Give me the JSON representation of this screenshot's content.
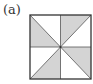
{
  "figure": {
    "label": "(a)",
    "colors": {
      "shade": "#d4d4d4",
      "stroke": "#333333",
      "background": "#ffffff"
    },
    "square": {
      "x": 30,
      "y": 15,
      "width": 61,
      "height": 64
    },
    "shaded_triangles": [
      "top-left quadrant, lower triangle",
      "top-right quadrant, upper triangle",
      "bottom-left quadrant, lower triangle",
      "bottom-right quadrant, upper triangle"
    ]
  }
}
